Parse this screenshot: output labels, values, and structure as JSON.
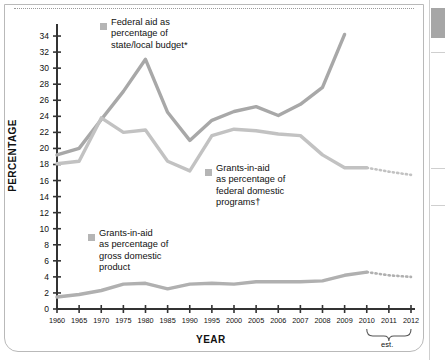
{
  "chart_data": {
    "type": "line",
    "title": "",
    "xlabel": "YEAR",
    "ylabel": "PERCENTAGE",
    "ylim": [
      0,
      35
    ],
    "yticks": [
      0,
      2,
      4,
      6,
      8,
      10,
      12,
      14,
      16,
      18,
      20,
      22,
      24,
      26,
      28,
      30,
      32,
      34
    ],
    "grid": false,
    "legend_position": "inline-annotations",
    "estimate_note": "est.",
    "estimate_years": [
      "2010",
      "2011",
      "2012"
    ],
    "categories": [
      "1960",
      "1965",
      "1970",
      "1975",
      "1980",
      "1985",
      "1990",
      "1995",
      "2000",
      "2005",
      "2006",
      "2007",
      "2008",
      "2009",
      "2010",
      "2011",
      "2012"
    ],
    "series": [
      {
        "name": "Federal aid as percentage of state/local budget*",
        "color": "#a8a8a8",
        "values": [
          19.2,
          20.0,
          23.6,
          27.1,
          31.1,
          24.5,
          21.0,
          23.5,
          24.6,
          25.2,
          24.1,
          25.5,
          27.6,
          34.2,
          null,
          null,
          null
        ],
        "estimated_values": []
      },
      {
        "name": "Grants-in-aid as percentage of federal domestic programs†",
        "color": "#c2c2c2",
        "values": [
          18.1,
          18.4,
          23.8,
          22.0,
          22.3,
          18.4,
          17.2,
          21.6,
          22.4,
          22.2,
          21.8,
          21.6,
          19.2,
          17.6,
          17.6,
          17.1,
          16.7
        ],
        "estimated_from": "2010"
      },
      {
        "name": "Grants-in-aid as percentage of gross domestic product",
        "color": "#b0b0b0",
        "values": [
          1.5,
          1.8,
          2.3,
          3.1,
          3.2,
          2.5,
          3.1,
          3.2,
          3.1,
          3.4,
          3.4,
          3.4,
          3.5,
          4.2,
          4.6,
          4.2,
          4.0
        ],
        "estimated_from": "2010"
      }
    ],
    "annotations": [
      {
        "id": "legend-federal-aid",
        "lines": [
          "Federal aid as",
          "percentage of",
          "state/local budget*"
        ]
      },
      {
        "id": "legend-grants-federal-programs",
        "lines": [
          "Grants-in-aid",
          "as percentage of",
          "federal domestic",
          "programs†"
        ]
      },
      {
        "id": "legend-grants-gdp",
        "lines": [
          "Grants-in-aid",
          "as percentage of",
          "gross domestic",
          "product"
        ]
      }
    ]
  },
  "axis": {
    "y_title": "PERCENTAGE",
    "x_title": "YEAR",
    "y_tick_labels": [
      "34",
      "32",
      "30",
      "28",
      "26",
      "24",
      "22",
      "20",
      "18",
      "16",
      "14",
      "12",
      "10",
      "8",
      "6",
      "4",
      "2",
      "0"
    ],
    "x_tick_labels": [
      "1960",
      "1965",
      "1970",
      "1975",
      "1980",
      "1985",
      "1990",
      "1995",
      "2000",
      "2005",
      "2006",
      "2007",
      "2008",
      "2009",
      "2010",
      "2011",
      "2012"
    ]
  },
  "legends": {
    "federal_aid": "Federal aid as\npercentage of\nstate/local budget*",
    "grants_federal_programs": "Grants-in-aid\nas percentage of\nfederal domestic\nprograms†",
    "grants_gdp": "Grants-in-aid\nas percentage of\ngross domestic\nproduct"
  },
  "notes": {
    "est_label": "est."
  },
  "colors": {
    "series_dark": "#a8a8a8",
    "series_mid": "#c2c2c2",
    "series_light": "#b0b0b0",
    "axis": "#333333",
    "text": "#111111"
  }
}
